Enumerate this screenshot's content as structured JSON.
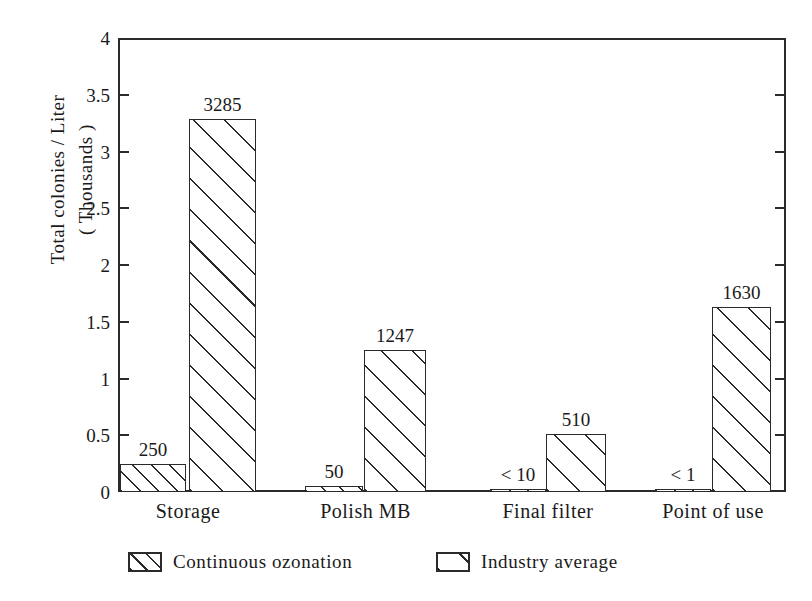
{
  "chart_data": {
    "type": "bar",
    "title": "",
    "xlabel": "",
    "ylabel": "Total colonies / Liter\n( Thousands )",
    "categories": [
      "Storage",
      "Polish MB",
      "Final filter",
      "Point of use"
    ],
    "ylim": [
      0,
      4
    ],
    "yticks": [
      "0",
      "0.5",
      "1",
      "1.5",
      "2",
      "2.5",
      "3",
      "3.5",
      "4"
    ],
    "ytick_values": [
      0,
      0.5,
      1,
      1.5,
      2,
      2.5,
      3,
      3.5,
      4
    ],
    "grid": false,
    "legend_position": "bottom",
    "units_note": "values labelled in colonies / Liter; axis in thousands",
    "series": [
      {
        "name": "Continuous ozonation",
        "hatch": "dense-diagonal",
        "values": [
          250,
          50,
          10,
          1
        ],
        "value_labels": [
          "250",
          "50",
          "< 10",
          "< 1"
        ]
      },
      {
        "name": "Industry average",
        "hatch": "wide-diagonal",
        "values": [
          3285,
          1247,
          510,
          1630
        ],
        "value_labels": [
          "3285",
          "1247",
          "510",
          "1630"
        ]
      }
    ]
  },
  "legend": {
    "items": [
      {
        "label": "Continuous ozonation",
        "swatch": "hatch-dense-swatch"
      },
      {
        "label": "Industry average",
        "swatch": "hatch-wide-swatch"
      }
    ]
  },
  "axis": {
    "y_title": "Total colonies / Liter\n( Thousands )"
  }
}
